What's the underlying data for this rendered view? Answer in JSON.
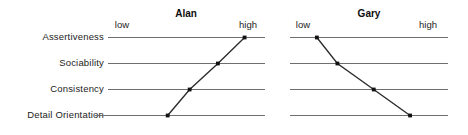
{
  "figure": {
    "width": 468,
    "height": 135,
    "background": "#ffffff",
    "axis_color": "#6e6e6e",
    "series_color": "#2b2b2b",
    "point_color": "#111111"
  },
  "traits": [
    {
      "label": "Assertiveness"
    },
    {
      "label": "Sociability"
    },
    {
      "label": "Consistency"
    },
    {
      "label": "Detail Orientation"
    }
  ],
  "scale": {
    "low_label": "low",
    "high_label": "high"
  },
  "panels": [
    {
      "title": "Alan"
    },
    {
      "title": "Gary"
    }
  ],
  "chart_data": {
    "type": "line",
    "title": "",
    "xlabel": "",
    "ylabel": "",
    "grid": false,
    "legend_position": "none",
    "orientation": "horizontal-trait-scales",
    "categories": [
      "Assertiveness",
      "Sociability",
      "Consistency",
      "Detail Orientation"
    ],
    "x_tick_labels": [
      "low",
      "high"
    ],
    "xlim": [
      0,
      100
    ],
    "panels": [
      {
        "name": "Alan",
        "series": [
          {
            "name": "Alan",
            "categories": [
              "Assertiveness",
              "Sociability",
              "Consistency",
              "Detail Orientation"
            ],
            "values": [
              87,
              70,
              52,
              38
            ]
          }
        ]
      },
      {
        "name": "Gary",
        "series": [
          {
            "name": "Gary",
            "categories": [
              "Assertiveness",
              "Sociability",
              "Consistency",
              "Detail Orientation"
            ],
            "values": [
              17,
              30,
              53,
              76
            ]
          }
        ]
      }
    ]
  }
}
